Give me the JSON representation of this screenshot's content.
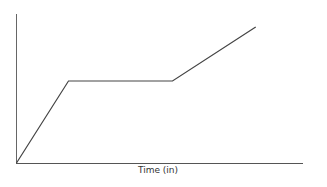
{
  "chart_data": {
    "type": "line",
    "title": "",
    "xlabel": "Time (in)",
    "ylabel": "",
    "grid": false,
    "legend": null,
    "series": [
      {
        "name": "",
        "x": [
          0,
          1,
          3,
          4.6
        ],
        "y": [
          0,
          1,
          1,
          1.66
        ]
      }
    ],
    "line_color": "#444444",
    "axis_color": "#555555"
  }
}
